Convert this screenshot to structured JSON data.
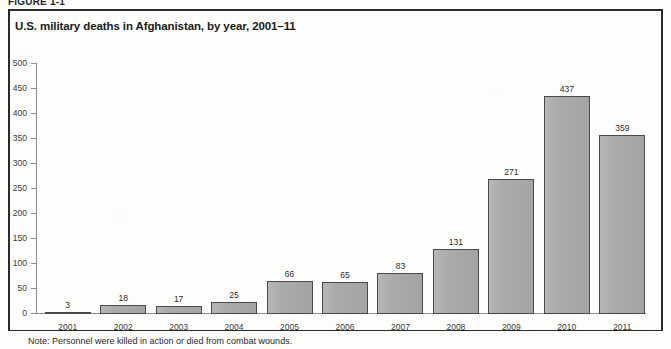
{
  "figure": {
    "top_caption_partial": "FIGURE 1-1",
    "note": "Note: Personnel were killed in action or died from combat wounds."
  },
  "chart_data": {
    "type": "bar",
    "title": "U.S. military deaths in Afghanistan, by year, 2001–11",
    "xlabel": "",
    "ylabel": "",
    "ylim": [
      0,
      500
    ],
    "yticks": [
      0,
      50,
      100,
      150,
      200,
      250,
      300,
      350,
      400,
      450,
      500
    ],
    "ytick_labels": [
      "0",
      "50",
      "100",
      "150",
      "200",
      "250",
      "300",
      "350",
      "400",
      "450",
      "500"
    ],
    "grid": false,
    "legend": null,
    "bar_color": "#a9a9a9",
    "bar_edge_color": "#4a4a4a",
    "categories": [
      "2001",
      "2002",
      "2003",
      "2004",
      "2005",
      "2006",
      "2007",
      "2008",
      "2009",
      "2010",
      "2011"
    ],
    "values": [
      3,
      18,
      17,
      25,
      66,
      65,
      83,
      131,
      271,
      437,
      359
    ],
    "value_labels": [
      "3",
      "18",
      "17",
      "25",
      "66",
      "65",
      "83",
      "131",
      "271",
      "437",
      "359"
    ]
  }
}
